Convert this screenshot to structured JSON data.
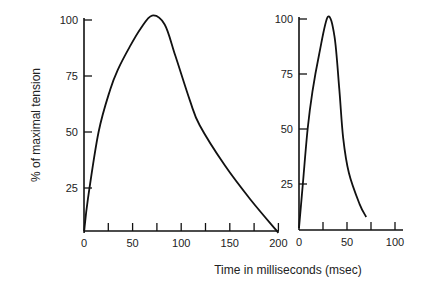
{
  "chart_data": [
    {
      "type": "line",
      "title": "",
      "xlabel": "Time in milliseconds (msec)",
      "ylabel": "% of maximal tension",
      "xlim": [
        0,
        200
      ],
      "ylim": [
        0,
        100
      ],
      "x_ticks": [
        0,
        25,
        50,
        75,
        100,
        125,
        150,
        175,
        200
      ],
      "x_tick_labels": [
        "0",
        "",
        "50",
        "",
        "100",
        "",
        "150",
        "",
        "200"
      ],
      "y_ticks": [
        25,
        50,
        75,
        100
      ],
      "y_tick_labels": [
        "25",
        "50",
        "75",
        "100"
      ],
      "grid": false,
      "series": [
        {
          "name": "slow twitch",
          "x": [
            0,
            4,
            15,
            27,
            35,
            47,
            58,
            70,
            83,
            94,
            109,
            119,
            145,
            171,
            200
          ],
          "y": [
            5,
            20,
            50,
            69,
            78,
            88,
            96,
            102,
            98,
            84,
            64,
            53,
            35,
            20,
            5
          ]
        }
      ]
    },
    {
      "type": "line",
      "title": "",
      "xlabel": "",
      "ylabel": "",
      "xlim": [
        0,
        100
      ],
      "ylim": [
        0,
        100
      ],
      "x_ticks": [
        0,
        25,
        50,
        75,
        100
      ],
      "x_tick_labels": [
        "0",
        "",
        "50",
        "",
        "100"
      ],
      "y_ticks": [
        25,
        50,
        75,
        100
      ],
      "y_tick_labels": [
        "25",
        "50",
        "75",
        "100"
      ],
      "grid": false,
      "series": [
        {
          "name": "fast twitch",
          "x": [
            0,
            4,
            9,
            14,
            21,
            30,
            37,
            42,
            46,
            52,
            63,
            70
          ],
          "y": [
            5,
            25,
            50,
            67,
            84,
            101,
            92,
            68,
            46,
            30,
            16,
            10
          ]
        }
      ]
    }
  ],
  "shared_xlabel": "Time in milliseconds (msec)",
  "shared_ylabel": "% of maximal tension"
}
